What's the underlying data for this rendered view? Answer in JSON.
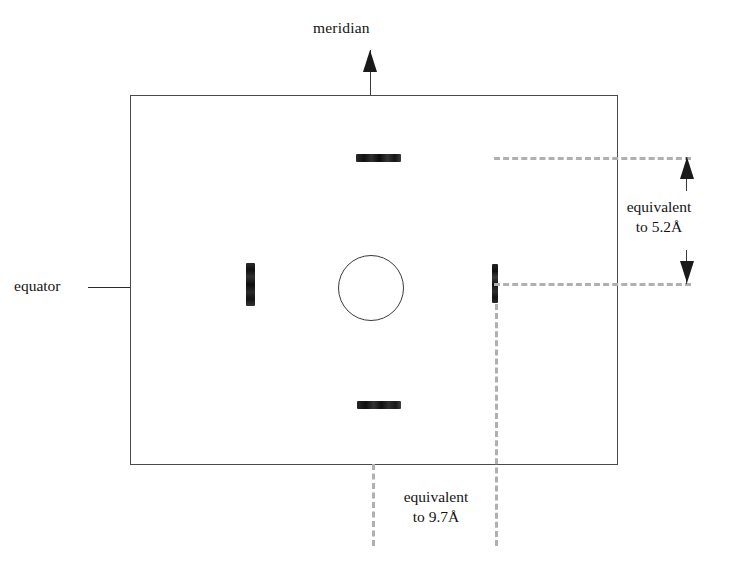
{
  "figure": {
    "type": "x-ray-fiber-diffraction-pattern-diagram",
    "labels": {
      "meridian": "meridian",
      "equator": "equator"
    },
    "annotations": {
      "right_scale_line1": "equivalent",
      "right_scale_line2": "to 5.2Å",
      "bottom_scale_line1": "equivalent",
      "bottom_scale_line2": "to 9.7Å"
    },
    "measurements": [
      {
        "axis": "meridional",
        "spacing": "5.2Å",
        "orientation": "vertical"
      },
      {
        "axis": "equatorial",
        "spacing": "9.7Å",
        "orientation": "horizontal"
      }
    ],
    "features": {
      "beam_stop": "central-circle",
      "reflections": [
        {
          "name": "meridional-top-reflection",
          "position": "top-meridian",
          "shape": "horizontal-streak"
        },
        {
          "name": "meridional-bottom-reflection",
          "position": "bottom-meridian",
          "shape": "horizontal-streak"
        },
        {
          "name": "equatorial-left-reflection",
          "position": "left-equator",
          "shape": "vertical-streak"
        },
        {
          "name": "equatorial-right-reflection",
          "position": "right-equator",
          "shape": "vertical-streak"
        }
      ]
    },
    "colors": {
      "frame": "#4a4a4a",
      "reflection": "#1a1a1a",
      "guide_dash": "#b0b0b0",
      "text": "#141414",
      "background": "#ffffff"
    }
  }
}
